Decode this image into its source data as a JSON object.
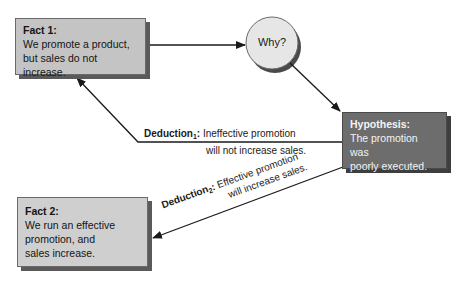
{
  "nodes": {
    "fact1": {
      "title": "Fact 1:",
      "lines": [
        "We promote a product,",
        "but sales do not increase."
      ]
    },
    "why": {
      "label": "Why?"
    },
    "hypothesis": {
      "title": "Hypothesis:",
      "lines": [
        "The promotion was",
        "poorly executed."
      ]
    },
    "fact2": {
      "title": "Fact 2:",
      "lines": [
        "We run an effective",
        "promotion, and",
        "sales increase."
      ]
    }
  },
  "edges": {
    "deduction1": {
      "label": "Deduction",
      "subscript": "1",
      "colon": ":",
      "text_line1": "Ineffective promotion",
      "text_line2": "will not increase sales."
    },
    "deduction2": {
      "label": "Deduction",
      "subscript": "2",
      "colon": ":",
      "text_line1": "Effective promotion",
      "text_line2": "will increase sales."
    }
  },
  "colors": {
    "fact_fill": "#c4c4c4",
    "hypothesis_fill": "#6d6d6d",
    "circle_fill": "#e6e6e6",
    "line": "#1a1a1a"
  }
}
